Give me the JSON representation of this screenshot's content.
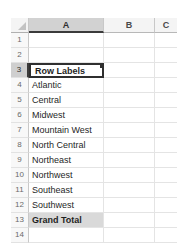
{
  "app": {
    "kind": "spreadsheet-pivot-table"
  },
  "colors": {
    "header_fill": "#f4f4f4",
    "header_selected_fill": "#d2d2d2",
    "gridline": "#e4e4e4",
    "total_fill": "#d9d9d9",
    "selection_border": "#2f2f2f"
  },
  "grid": {
    "select_all_icon": "select-all-triangle-icon",
    "columns": [
      {
        "label": "A",
        "selected": true
      },
      {
        "label": "B",
        "selected": false
      },
      {
        "label": "C",
        "selected": false
      }
    ],
    "rows": [
      {
        "number": "1",
        "a": "",
        "selected": false,
        "bold": false,
        "filled": false
      },
      {
        "number": "2",
        "a": "",
        "selected": false,
        "bold": false,
        "filled": false
      },
      {
        "number": "3",
        "a": "Row Labels",
        "selected": true,
        "bold": true,
        "filled": false
      },
      {
        "number": "4",
        "a": "Atlantic",
        "selected": false,
        "bold": false,
        "filled": false
      },
      {
        "number": "5",
        "a": "Central",
        "selected": false,
        "bold": false,
        "filled": false
      },
      {
        "number": "6",
        "a": "Midwest",
        "selected": false,
        "bold": false,
        "filled": false
      },
      {
        "number": "7",
        "a": "Mountain West",
        "selected": false,
        "bold": false,
        "filled": false
      },
      {
        "number": "8",
        "a": "North Central",
        "selected": false,
        "bold": false,
        "filled": false
      },
      {
        "number": "9",
        "a": "Northeast",
        "selected": false,
        "bold": false,
        "filled": false
      },
      {
        "number": "10",
        "a": "Northwest",
        "selected": false,
        "bold": false,
        "filled": false
      },
      {
        "number": "11",
        "a": "Southeast",
        "selected": false,
        "bold": false,
        "filled": false
      },
      {
        "number": "12",
        "a": "Southwest",
        "selected": false,
        "bold": false,
        "filled": false
      },
      {
        "number": "13",
        "a": "Grand Total",
        "selected": false,
        "bold": true,
        "filled": true
      },
      {
        "number": "14",
        "a": "",
        "selected": false,
        "bold": false,
        "filled": false
      }
    ]
  },
  "active_cell": {
    "value": "Row Labels",
    "filter_icon": "filter-dropdown-arrow-icon",
    "fill_handle": "fill-handle"
  }
}
